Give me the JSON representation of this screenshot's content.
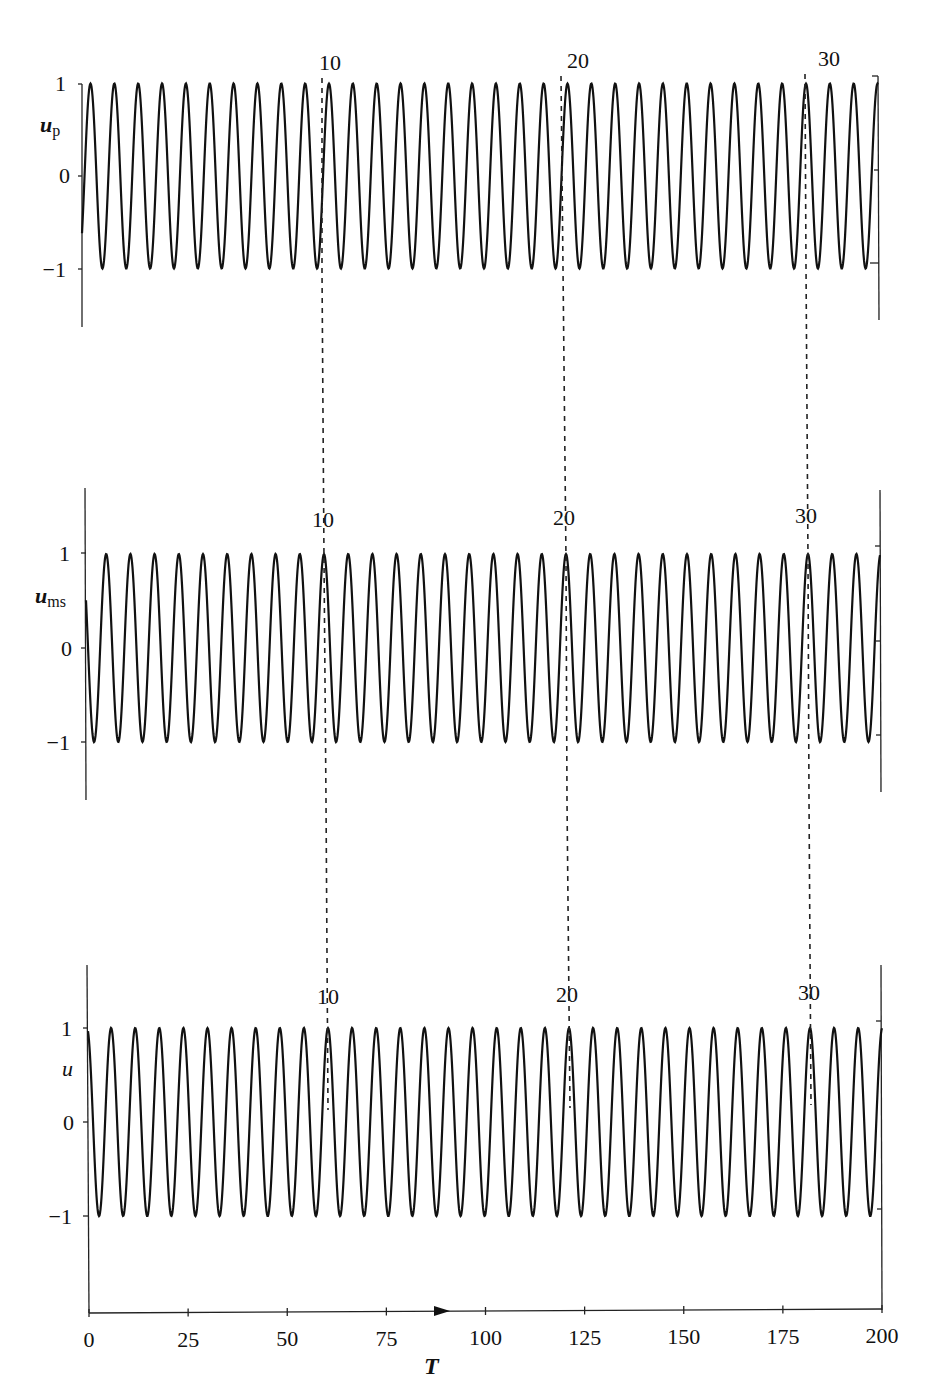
{
  "chart_data": {
    "type": "line",
    "title": "",
    "xlabel": "T",
    "x_ticks": [
      0,
      25,
      50,
      75,
      100,
      125,
      150,
      175,
      200
    ],
    "xlim": [
      0,
      200
    ],
    "grid": false,
    "legend": null,
    "period_T": 6.05,
    "annotations": {
      "peak_markers": [
        "10",
        "20",
        "30"
      ],
      "note": "Vertical dashed lines connect the 10th, 20th and 30th peaks across the three panels; an arrow on the T axis points right."
    },
    "panels": [
      {
        "id": "top",
        "ylabel": "u",
        "ylabel_sub": "p",
        "y_ticks": [
          "1",
          "0",
          "−1"
        ],
        "y_tick_values": [
          1,
          0,
          -1
        ],
        "ylim": [
          -1.7,
          1.2
        ],
        "amplitude": 1.0,
        "start_value": 1.0,
        "peak_positions_px": {
          "10": 329,
          "20": 563,
          "30": 806
        },
        "description": "cos-like oscillation u_p, amplitude 1, ~33 cycles over T in [0,200]"
      },
      {
        "id": "middle",
        "ylabel": "u",
        "ylabel_sub": "ms",
        "y_ticks": [
          "1",
          "0",
          "−1"
        ],
        "y_tick_values": [
          1,
          0,
          -1
        ],
        "ylim": [
          -1.6,
          1.6
        ],
        "amplitude": 1.0,
        "start_value": 1.0,
        "peak_positions_px": {
          "10": 324,
          "20": 566,
          "30": 808
        },
        "description": "multiple-scales approximation u_ms, amplitude 1"
      },
      {
        "id": "bottom",
        "ylabel": "u",
        "ylabel_sub": "",
        "y_ticks": [
          "1",
          "0",
          "−1"
        ],
        "y_tick_values": [
          1,
          0,
          -1
        ],
        "ylim": [
          -2.0,
          1.6
        ],
        "amplitude": 1.0,
        "start_value": 1.0,
        "peak_positions_px": {
          "10": 328,
          "20": 568,
          "30": 810
        },
        "description": "numerical solution u, amplitude 1"
      }
    ]
  },
  "labels": {
    "top_ylabel": "u",
    "top_ylabel_sub": "p",
    "middle_ylabel": "u",
    "middle_ylabel_sub": "ms",
    "bottom_ylabel": "u",
    "x_axis_label": "T",
    "ytick_1": "1",
    "ytick_0": "0",
    "ytick_m1": "−1",
    "peak10": "10",
    "peak20": "20",
    "peak30": "30",
    "xticks": [
      "0",
      "25",
      "50",
      "75",
      "100",
      "125",
      "150",
      "175",
      "200"
    ]
  },
  "style": {
    "line_color": "#111111",
    "dash_color": "#222222"
  }
}
